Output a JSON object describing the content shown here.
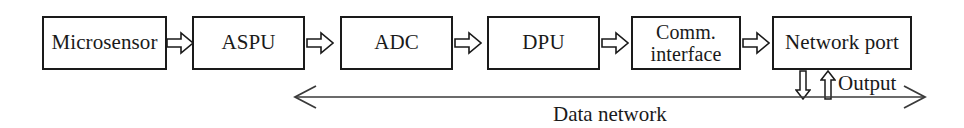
{
  "diagram": {
    "type": "block-flow",
    "line_color": "#1a1a1a",
    "background_color": "#ffffff",
    "nodes": [
      {
        "id": "microsensor",
        "label": "Microsensor",
        "x": 42,
        "y": 16,
        "width": 125,
        "height": 54
      },
      {
        "id": "aspu",
        "label": "ASPU",
        "x": 192,
        "y": 16,
        "width": 113,
        "height": 54
      },
      {
        "id": "adc",
        "label": "ADC",
        "x": 340,
        "y": 16,
        "width": 113,
        "height": 54
      },
      {
        "id": "dpu",
        "label": "DPU",
        "x": 487,
        "y": 16,
        "width": 113,
        "height": 54
      },
      {
        "id": "comm-interface",
        "label": "Comm.\ninterface",
        "x": 631,
        "y": 16,
        "width": 110,
        "height": 54
      },
      {
        "id": "network-port",
        "label": "Network port",
        "x": 772,
        "y": 16,
        "width": 140,
        "height": 54
      }
    ],
    "connectors": [
      {
        "id": "microsensor-to-aspu",
        "x": 166,
        "y": 30,
        "direction": "right"
      },
      {
        "id": "aspu-to-adc",
        "x": 306,
        "y": 30,
        "direction": "right"
      },
      {
        "id": "adc-to-dpu",
        "x": 454,
        "y": 30,
        "direction": "right"
      },
      {
        "id": "dpu-to-comm-interface",
        "x": 601,
        "y": 30,
        "direction": "right"
      },
      {
        "id": "comm-interface-to-network",
        "x": 742,
        "y": 30,
        "direction": "right"
      }
    ],
    "vertical_arrows": [
      {
        "id": "network-port-input-down",
        "x": 795,
        "y": 70,
        "direction": "down"
      },
      {
        "id": "network-port-output-up",
        "x": 820,
        "y": 70,
        "direction": "up"
      }
    ],
    "network_bus": {
      "id": "data-network-bus",
      "caption": "Data network",
      "direction": "bidirectional",
      "left_x": 290,
      "right_x": 930,
      "y": 97
    },
    "output": {
      "label": "Output"
    }
  }
}
